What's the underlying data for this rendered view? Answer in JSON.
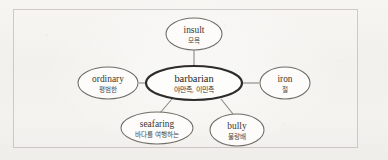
{
  "figure": {
    "type": "word-web-diagram",
    "colors": {
      "page_background": "#fbfaf8",
      "frame_border": "#78746e",
      "node_stroke": "#6f6c66",
      "central_node_stroke": "#2e2c29",
      "edge_stroke": "#8b8882",
      "term_text": "#3a3733",
      "gloss_text": "#4b4844"
    },
    "central_node": {
      "id": "barbarian",
      "term": "barbarian",
      "gloss": "야만족, 이민족",
      "cx": 194,
      "cy": 83,
      "rx": 48,
      "ry": 17
    },
    "satellite_nodes": [
      {
        "id": "insult",
        "term": "insult",
        "gloss": "모욕",
        "cx": 194,
        "cy": 34,
        "rx": 28,
        "ry": 16,
        "position": "top"
      },
      {
        "id": "ordinary",
        "term": "ordinary",
        "gloss": "평범한",
        "cx": 108,
        "cy": 83,
        "rx": 30,
        "ry": 16,
        "position": "left"
      },
      {
        "id": "iron",
        "term": "iron",
        "gloss": "철",
        "cx": 285,
        "cy": 83,
        "rx": 25,
        "ry": 16,
        "position": "right"
      },
      {
        "id": "seafaring",
        "term": "seafaring",
        "gloss": "바다를 여행하는",
        "cx": 157,
        "cy": 128,
        "rx": 36,
        "ry": 16,
        "position": "bottom-left"
      },
      {
        "id": "bully",
        "term": "bully",
        "gloss": "불량배",
        "cx": 237,
        "cy": 130,
        "rx": 27,
        "ry": 16,
        "position": "bottom-right"
      }
    ],
    "edges": [
      {
        "id": "edge-barbarian-insult",
        "from": "barbarian",
        "to": "insult",
        "x1": 194,
        "y1": 66,
        "x2": 194,
        "y2": 50
      },
      {
        "id": "edge-barbarian-ordinary",
        "from": "barbarian",
        "to": "ordinary",
        "x1": 145,
        "y1": 83,
        "x2": 139,
        "y2": 83
      },
      {
        "id": "edge-barbarian-iron",
        "from": "barbarian",
        "to": "iron",
        "x1": 243,
        "y1": 83,
        "x2": 259,
        "y2": 83
      },
      {
        "id": "edge-barbarian-seafaring",
        "from": "barbarian",
        "to": "seafaring",
        "x1": 172,
        "y1": 99,
        "x2": 160,
        "y2": 113
      },
      {
        "id": "edge-barbarian-bully",
        "from": "barbarian",
        "to": "bully",
        "x1": 221,
        "y1": 99,
        "x2": 233,
        "y2": 114
      }
    ]
  }
}
